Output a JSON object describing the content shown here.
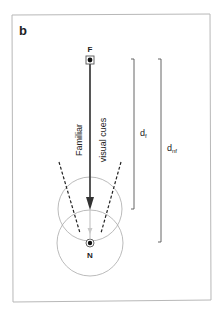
{
  "panel": {
    "label": "b"
  },
  "points": {
    "far": {
      "label": "F"
    },
    "near": {
      "label": "N"
    }
  },
  "labels": {
    "familiar": "Familiar",
    "visual_cues": "visual cues"
  },
  "distances": {
    "d_f": {
      "base": "d",
      "sub": "f"
    },
    "d_nf": {
      "base": "d",
      "sub": "nf"
    }
  },
  "colors": {
    "frame": "#b8b8b8",
    "main_line": "#444444",
    "faint_line": "#bbbbbb",
    "circle": "#aaaaaa",
    "dashed": "#222222",
    "bracket": "#555555",
    "text": "#222222"
  }
}
